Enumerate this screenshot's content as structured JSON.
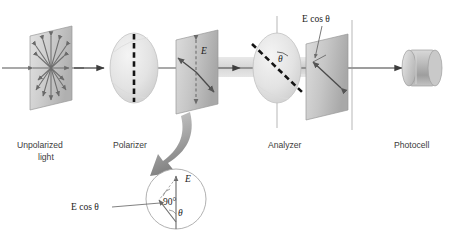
{
  "figure": {
    "kind": "optics-diagram",
    "topic": "polarization-of-light-malus-law",
    "background": "#ffffff"
  },
  "labels": {
    "unpolarized_line1": "Unpolarized",
    "unpolarized_line2": "light",
    "polarizer": "Polarizer",
    "analyzer": "Analyzer",
    "photocell": "Photocell"
  },
  "annotations": {
    "e_field": "E",
    "e_cos_theta_top": "E cos θ",
    "e_cos_theta_inset": "E cos θ",
    "theta_analyzer": "θ",
    "theta_inset": "θ",
    "right_angle": "90°",
    "e_inset": "E"
  },
  "colors": {
    "plane_fill_light": "#d8d8d8",
    "plane_fill_dark": "#b9b9b9",
    "plane_edge": "#8f8f8f",
    "disc_fill": "#e6e6e6",
    "disc_edge": "#bdbdbd",
    "beam": "#c9c9c9",
    "axis_line": "#555555",
    "arrow_dark": "#4a4a4a",
    "dash_axis": "#141414",
    "label_text": "#3b3b3b",
    "math_text": "#1a1a1a",
    "curved_arrow": "#9a9a9a",
    "photocell_body": "#b0b0b0"
  },
  "elements": [
    {
      "name": "unpolarized-light-plane",
      "type": "plane",
      "arrows": 8,
      "arrow_style": "double-headed-starburst"
    },
    {
      "name": "polarizer-disc",
      "type": "disc",
      "axis": "vertical",
      "axis_style": "thick-dashed"
    },
    {
      "name": "polarized-light-plane",
      "type": "plane",
      "vector": "E",
      "orientation": "vertical"
    },
    {
      "name": "analyzer-disc",
      "type": "disc",
      "axis": "tilted",
      "axis_style": "thick-dashed",
      "tilt_label": "θ"
    },
    {
      "name": "transmitted-light-plane",
      "type": "plane",
      "vector": "E cos θ",
      "orientation": "tilted"
    },
    {
      "name": "photocell-cylinder",
      "type": "detector"
    }
  ],
  "inset": {
    "name": "magnified-vector-detail",
    "shape": "circle",
    "vectors": [
      "E",
      "E cos θ"
    ],
    "angles": [
      "90°",
      "θ"
    ]
  }
}
